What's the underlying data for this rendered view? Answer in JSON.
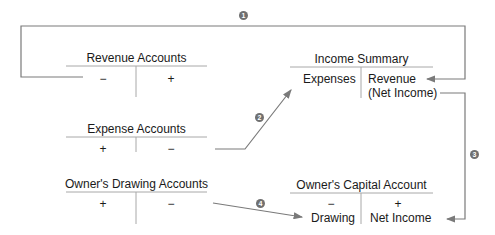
{
  "diagram": {
    "accounts": {
      "revenue": {
        "title": "Revenue Accounts",
        "left": "−",
        "right": "+"
      },
      "expense": {
        "title": "Expense Accounts",
        "left": "+",
        "right": "−"
      },
      "drawing": {
        "title": "Owner's Drawing Accounts",
        "left": "+",
        "right": "−"
      },
      "income_summary": {
        "title": "Income Summary",
        "left": "Expenses",
        "right_line1": "Revenue",
        "right_line2": "(Net Income)"
      },
      "capital": {
        "title": "Owner's Capital Account",
        "left_sign": "−",
        "left_label": "Drawing",
        "right_sign": "+",
        "right_label": "Net Income"
      }
    },
    "steps": [
      {
        "number": "1",
        "from": "Revenue Accounts",
        "to": "Income Summary (Revenue)"
      },
      {
        "number": "2",
        "from": "Expense Accounts",
        "to": "Income Summary (Expenses)"
      },
      {
        "number": "3",
        "from": "Income Summary (Net Income)",
        "to": "Owner's Capital Account (Net Income)"
      },
      {
        "number": "4",
        "from": "Owner's Drawing Accounts",
        "to": "Owner's Capital Account (Drawing)"
      }
    ],
    "colors": {
      "line": "#7a7a7a",
      "ledger": "#9a9a9a",
      "text": "#1a1a1a",
      "marker": "#707070"
    }
  }
}
